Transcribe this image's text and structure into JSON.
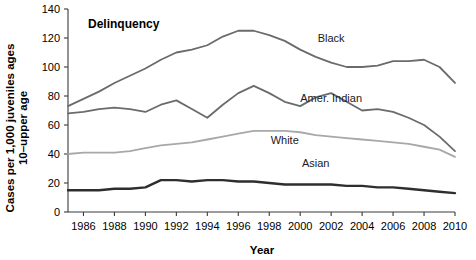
{
  "chart_data": {
    "type": "line",
    "title": "Delinquency",
    "xlabel": "Year",
    "ylabel": "Cases per 1,000 juveniles ages 10–upper age",
    "ylabel_line1": "Cases per 1,000 juveniles ages",
    "ylabel_line2": "10–upper age",
    "xlim": [
      1985,
      2010
    ],
    "ylim": [
      0,
      140
    ],
    "grid": false,
    "legend": "inline-labels",
    "xticks": [
      1986,
      1988,
      1990,
      1992,
      1994,
      1996,
      1998,
      2000,
      2002,
      2004,
      2006,
      2008,
      2010
    ],
    "yticks": [
      0,
      20,
      40,
      60,
      80,
      100,
      120,
      140
    ],
    "x": [
      1985,
      1986,
      1987,
      1988,
      1989,
      1990,
      1991,
      1992,
      1993,
      1994,
      1995,
      1996,
      1997,
      1998,
      1999,
      2000,
      2001,
      2002,
      2003,
      2004,
      2005,
      2006,
      2007,
      2008,
      2009,
      2010
    ],
    "series": [
      {
        "name": "Black",
        "color": "#6b6b6b",
        "width": 1.8,
        "label": "Black",
        "label_x": 2002,
        "label_y": 117,
        "values": [
          73,
          78,
          83,
          89,
          94,
          99,
          105,
          110,
          112,
          115,
          121,
          125,
          125,
          122,
          118,
          112,
          107,
          103,
          100,
          100,
          101,
          104,
          104,
          105,
          100,
          89
        ]
      },
      {
        "name": "Amer. Indian",
        "color": "#6b6b6b",
        "width": 1.8,
        "label": "Amer. Indian",
        "label_x": 2002,
        "label_y": 76,
        "values": [
          68,
          69,
          71,
          72,
          71,
          69,
          74,
          77,
          71,
          65,
          74,
          82,
          87,
          82,
          76,
          73,
          79,
          82,
          76,
          70,
          71,
          69,
          65,
          60,
          52,
          42
        ]
      },
      {
        "name": "White",
        "color": "#a8a8a8",
        "width": 1.8,
        "label": "White",
        "label_x": 1999,
        "label_y": 47,
        "values": [
          40,
          41,
          41,
          41,
          42,
          44,
          46,
          47,
          48,
          50,
          52,
          54,
          56,
          56,
          56,
          55,
          53,
          52,
          51,
          50,
          49,
          48,
          47,
          45,
          43,
          38
        ]
      },
      {
        "name": "Asian",
        "color": "#2e2e2e",
        "width": 2.4,
        "label": "Asian",
        "label_x": 2001,
        "label_y": 31,
        "values": [
          15,
          15,
          15,
          16,
          16,
          17,
          22,
          22,
          21,
          22,
          22,
          21,
          21,
          20,
          19,
          19,
          19,
          19,
          18,
          18,
          17,
          17,
          16,
          15,
          14,
          13
        ]
      }
    ]
  }
}
